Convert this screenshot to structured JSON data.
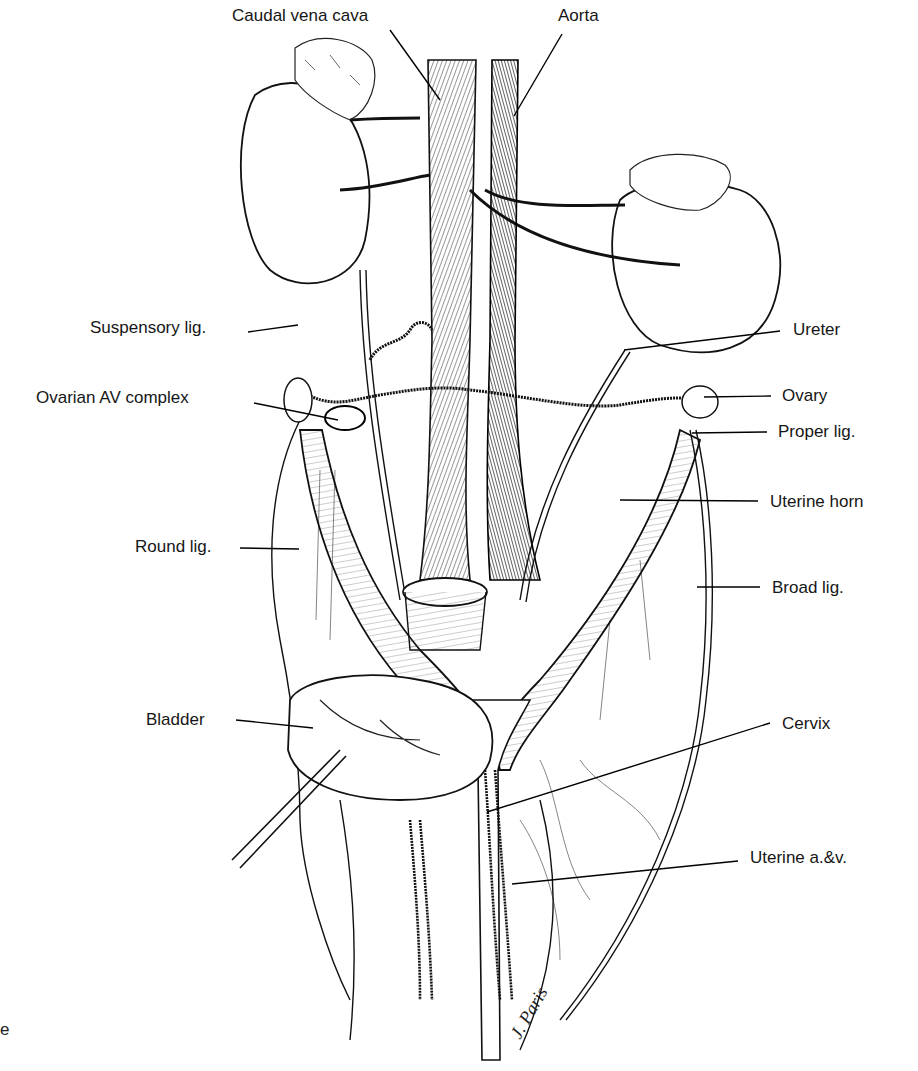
{
  "figure": {
    "signature": "J. Paris",
    "cropped_edge_text": "e"
  },
  "labels": [
    {
      "id": "caudal-vena-cava",
      "text": "Caudal vena cava",
      "x": 232,
      "y": 6,
      "line": [
        390,
        30,
        440,
        100
      ]
    },
    {
      "id": "aorta",
      "text": "Aorta",
      "x": 558,
      "y": 6,
      "line": [
        562,
        34,
        514,
        116
      ]
    },
    {
      "id": "suspensory-lig",
      "text": "Suspensory lig.",
      "x": 90,
      "y": 318,
      "line": [
        248,
        332,
        298,
        325
      ]
    },
    {
      "id": "ovarian-av-complex",
      "text": "Ovarian AV complex",
      "x": 36,
      "y": 388,
      "line": [
        254,
        403,
        338,
        420
      ]
    },
    {
      "id": "ureter",
      "text": "Ureter",
      "x": 793,
      "y": 320,
      "line": [
        780,
        331,
        624,
        350
      ]
    },
    {
      "id": "ovary",
      "text": "Ovary",
      "x": 782,
      "y": 386,
      "line": [
        771,
        396,
        704,
        397
      ]
    },
    {
      "id": "proper-lig",
      "text": "Proper lig.",
      "x": 778,
      "y": 422,
      "line": [
        767,
        432,
        692,
        433
      ]
    },
    {
      "id": "uterine-horn",
      "text": "Uterine horn",
      "x": 770,
      "y": 492,
      "line": [
        758,
        501,
        620,
        500
      ]
    },
    {
      "id": "round-lig",
      "text": "Round lig.",
      "x": 135,
      "y": 537,
      "line": [
        240,
        548,
        299,
        549
      ]
    },
    {
      "id": "broad-lig",
      "text": "Broad lig.",
      "x": 772,
      "y": 578,
      "line": [
        760,
        587,
        697,
        587
      ]
    },
    {
      "id": "bladder",
      "text": "Bladder",
      "x": 146,
      "y": 710,
      "line": [
        236,
        720,
        313,
        728
      ]
    },
    {
      "id": "cervix",
      "text": "Cervix",
      "x": 782,
      "y": 714,
      "line": [
        770,
        723,
        487,
        812
      ]
    },
    {
      "id": "uterine-av",
      "text": "Uterine a.&v.",
      "x": 750,
      "y": 848,
      "line": [
        738,
        861,
        512,
        884
      ]
    }
  ]
}
